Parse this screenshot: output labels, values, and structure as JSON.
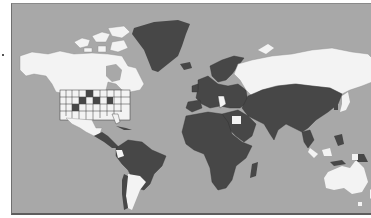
{
  "map": {
    "type": "world-choropleth",
    "colors": {
      "ocean": "#a8a8a8",
      "category_dark": "#474747",
      "category_light": "#f3f3f3",
      "border": "#2e2e2e"
    },
    "legend": [],
    "regions_light": [
      "Canada",
      "United States (most states)",
      "Alaska",
      "Mexico",
      "Russia",
      "Argentina",
      "Ecuador",
      "Egypt",
      "Australia",
      "Japan",
      "Parts of Indonesia",
      "Papua New Guinea (west)",
      "Arctic islands"
    ],
    "regions_dark": [
      "Greenland",
      "Iceland",
      "Central America",
      "South America (most)",
      "Africa (most)",
      "Europe (most)",
      "Middle East",
      "Central Asia",
      "China",
      "India",
      "Southeast Asia",
      "Mongolia",
      "Scandinavia",
      "Madagascar",
      "Papua New Guinea (east)",
      "Several US states"
    ]
  }
}
